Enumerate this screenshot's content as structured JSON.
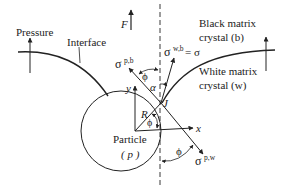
{
  "labels": {
    "pressure": "Pressure",
    "interface": "Interface",
    "force": "F",
    "black_matrix_line1": "Black matrix",
    "black_matrix_line2": "crystal (b)",
    "white_matrix_line1": "White matrix",
    "white_matrix_line2": "crystal (w)",
    "particle_line1": "Particle",
    "particle_line2": "( p )",
    "sigma_pb": "σ",
    "sigma_pb_sup": "p,b",
    "sigma_wb": "σ",
    "sigma_wb_sup": "w,b",
    "sigma_wb_eq": "= σ",
    "sigma_pw": "σ",
    "sigma_pw_sup": "p,w",
    "phi_top": "ϕ",
    "alpha": "α",
    "phi_inner": "ϕ",
    "phi_bottom": "ϕ",
    "radius": "R",
    "junction": "J",
    "axis_x": "x",
    "axis_y": "y"
  },
  "colors": {
    "line": "#222222",
    "background": "#ffffff"
  }
}
